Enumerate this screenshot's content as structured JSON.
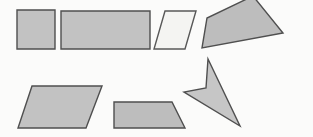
{
  "figure": {
    "kind": "geometry-shapes-worksheet",
    "width": 313,
    "height": 137,
    "background_color": "#fbfbfa",
    "default_fill": "#c0c0c0",
    "default_stroke": "#555555",
    "stroke_width": 1.4
  },
  "shapes": [
    {
      "id": "square-top-left",
      "label": "square",
      "sides": 4,
      "fill": "#c2c2c2",
      "stroke": "#4f4f4f",
      "points": "17,10 55,10 55,49 17,49"
    },
    {
      "id": "rectangle-top",
      "label": "rectangle",
      "sides": 4,
      "fill": "#c2c2c2",
      "stroke": "#4f4f4f",
      "points": "61,11 150,11 150,49 61,49"
    },
    {
      "id": "parallelogram-top-light",
      "label": "parallelogram",
      "sides": 4,
      "fill": "#f4f4f2",
      "stroke": "#585858",
      "points": "165,11 196,11 185,49 154,49"
    },
    {
      "id": "quadrilateral-top-right",
      "label": "quadrilateral",
      "sides": 4,
      "fill": "#bdbdbd",
      "stroke": "#4f4f4f",
      "points": "253,-4 283,33 202,48 207,18"
    },
    {
      "id": "parallelogram-bottom-left",
      "label": "parallelogram",
      "sides": 4,
      "fill": "#c2c2c2",
      "stroke": "#4f4f4f",
      "points": "32,86 102,86 86,128 18,128"
    },
    {
      "id": "trapezoid-bottom-center",
      "label": "trapezoid",
      "sides": 4,
      "fill": "#bdbdbd",
      "stroke": "#4f4f4f",
      "points": "114,102 172,102 185,128 114,128"
    },
    {
      "id": "dart-bottom-right",
      "label": "concave-quadrilateral-dart",
      "sides": 4,
      "fill": "#c6c6c6",
      "stroke": "#4f4f4f",
      "points": "208,59 240,126 184,92 206,88"
    }
  ]
}
